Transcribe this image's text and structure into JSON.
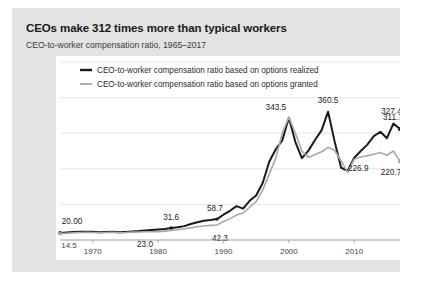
{
  "card": {
    "title": "CEOs make 312 times more than typical workers",
    "subtitle": "CEO-to-worker compensation ratio,  1965–2017"
  },
  "chart_data": {
    "type": "line",
    "title": "CEOs make 312 times more than typical workers",
    "subtitle": "CEO-to-worker compensation ratio,  1965–2017",
    "xlabel": "",
    "ylabel": "",
    "xlim": [
      1965,
      2017
    ],
    "ylim": [
      0,
      500
    ],
    "yticks": [
      0,
      100,
      200,
      300,
      400,
      500
    ],
    "xticks": [
      1970,
      1980,
      1990,
      2000,
      2010
    ],
    "grid": true,
    "legend_position": "top-left",
    "x": [
      1965,
      1966,
      1967,
      1968,
      1969,
      1970,
      1971,
      1972,
      1973,
      1974,
      1975,
      1976,
      1977,
      1978,
      1979,
      1980,
      1981,
      1982,
      1983,
      1984,
      1985,
      1986,
      1987,
      1988,
      1989,
      1990,
      1991,
      1992,
      1993,
      1994,
      1995,
      1996,
      1997,
      1998,
      1999,
      2000,
      2001,
      2002,
      2003,
      2004,
      2005,
      2006,
      2007,
      2008,
      2009,
      2010,
      2011,
      2012,
      2013,
      2014,
      2015,
      2016,
      2017
    ],
    "series": [
      {
        "name": "CEO-to-worker compensation ratio based on options realized",
        "color": "#1a1a1a",
        "values": [
          20.0,
          21.2,
          22.4,
          23.0,
          23.5,
          23.0,
          22.0,
          22.8,
          23.4,
          22.0,
          22.8,
          24.0,
          25.0,
          26.5,
          28.0,
          29.5,
          31.0,
          33.5,
          36.0,
          39.0,
          45.0,
          50.0,
          54.0,
          56.0,
          58.7,
          71.0,
          82.0,
          95.0,
          88.0,
          110.0,
          125.0,
          160.0,
          220.0,
          255.0,
          280.0,
          343.5,
          275.0,
          230.0,
          251.0,
          281.0,
          308.0,
          360.5,
          277.0,
          203.0,
          194.0,
          231.0,
          250.0,
          268.0,
          292.0,
          304.0,
          286.0,
          327.4,
          311.7
        ]
      },
      {
        "name": "CEO-to-worker compensation ratio based on options granted",
        "color": "#a8a8a8",
        "values": [
          18.0,
          19.0,
          20.0,
          21.0,
          21.5,
          21.0,
          20.5,
          21.0,
          21.5,
          20.5,
          21.0,
          22.0,
          22.5,
          23.0,
          23.0,
          23.0,
          25.0,
          27.0,
          29.0,
          31.5,
          34.0,
          37.0,
          39.5,
          41.0,
          42.3,
          52.0,
          60.0,
          70.0,
          76.0,
          92.0,
          108.0,
          140.0,
          185.0,
          230.0,
          300.0,
          345.0,
          300.0,
          250.0,
          232.0,
          240.0,
          248.0,
          260.0,
          252.0,
          222.0,
          190.0,
          226.9,
          233.0,
          237.0,
          241.0,
          246.0,
          238.0,
          250.0,
          220.7
        ]
      }
    ],
    "annotations": [
      {
        "text": "20.00",
        "x": 1965,
        "y": 20.0,
        "dx": 12,
        "dy": -9
      },
      {
        "text": "23.0",
        "x": 1978,
        "y": 23.0,
        "dx": 0,
        "dy": 15
      },
      {
        "text": "31.6",
        "x": 1982,
        "y": 31.6,
        "dx": 0,
        "dy": -9
      },
      {
        "text": "42.3",
        "x": 1989,
        "y": 42.3,
        "dx": 3,
        "dy": 16
      },
      {
        "text": "58.7",
        "x": 1989,
        "y": 58.7,
        "dx": -2,
        "dy": -8
      },
      {
        "text": "343.5",
        "x": 2000,
        "y": 343.5,
        "dx": -13,
        "dy": -8
      },
      {
        "text": "360.5",
        "x": 2006,
        "y": 360.5,
        "dx": 0,
        "dy": -9
      },
      {
        "text": "226.9",
        "x": 2010,
        "y": 226.9,
        "dx": 4,
        "dy": 12
      },
      {
        "text": "327.4",
        "x": 2016,
        "y": 327.4,
        "dx": -2,
        "dy": -9
      },
      {
        "text": "311.7",
        "x": 2017,
        "y": 311.7,
        "dx": -7,
        "dy": -9
      },
      {
        "text": "220.7",
        "x": 2017,
        "y": 220.7,
        "dx": -9,
        "dy": 14
      }
    ],
    "axis_start_label": "14.5"
  }
}
